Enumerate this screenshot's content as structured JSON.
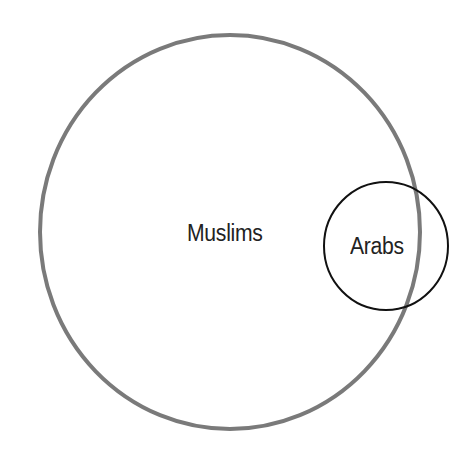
{
  "diagram": {
    "type": "venn",
    "sets": [
      {
        "id": "muslims",
        "label": "Muslims",
        "shape": {
          "cx": 230,
          "cy": 232,
          "rx": 190,
          "ry": 197
        },
        "stroke": "#7a7a7a",
        "stroke_width": 4
      },
      {
        "id": "arabs",
        "label": "Arabs",
        "shape": {
          "cx": 386,
          "cy": 246,
          "rx": 62,
          "ry": 64
        },
        "stroke": "#111111",
        "stroke_width": 2
      }
    ],
    "relationship": "Arabs circle partially overlaps the right edge of the Muslims circle",
    "background": "#ffffff",
    "text_color": "#222222"
  }
}
